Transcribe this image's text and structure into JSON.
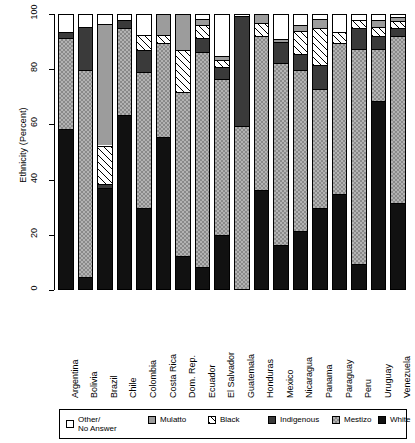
{
  "chart_data": {
    "type": "bar",
    "subtype": "stacked-bar-100",
    "title": "",
    "xlabel": "",
    "ylabel": "Ethnicity (Percent)",
    "ylim": [
      0,
      100
    ],
    "yticks": [
      0,
      20,
      40,
      60,
      80,
      100
    ],
    "grid": false,
    "legend_position": "bottom",
    "stack_order_bottom_to_top": [
      "White",
      "Indigenous",
      "Black",
      "Mulatto",
      "Mestizo",
      "Other/No Answer"
    ],
    "categories": [
      "Argentina",
      "Bolivia",
      "Brazil",
      "Chile",
      "Colombia",
      "Costa Rica",
      "Dom. Rep.",
      "Ecuador",
      "El Salvador",
      "Guatemala",
      "Honduras",
      "Mexico",
      "Nicaragua",
      "Panama",
      "Paraguay",
      "Peru",
      "Uruguay",
      "Venezuela"
    ],
    "series": [
      {
        "name": "White",
        "values": [
          58.0,
          4.5,
          36.5,
          63.0,
          29.5,
          55.0,
          12.0,
          8.0,
          19.5,
          0.0,
          36.0,
          16.0,
          21.0,
          29.5,
          34.5,
          9.0,
          68.0,
          31.0
        ]
      },
      {
        "name": "Indigenous",
        "values": [
          1.5,
          75.0,
          1.5,
          0.0,
          0.0,
          0.0,
          0.0,
          0.0,
          0.0,
          59.0,
          0.0,
          66.0,
          0.0,
          43.5,
          0.0,
          0.0,
          0.0,
          0.0
        ]
      },
      {
        "name": "Black",
        "values": [
          0.0,
          0.0,
          14.0,
          0.0,
          0.0,
          0.0,
          0.0,
          0.0,
          0.0,
          0.0,
          0.0,
          0.0,
          0.0,
          0.0,
          0.0,
          0.0,
          0.0,
          0.0
        ]
      },
      {
        "name": "Mulatto",
        "values": [
          0.0,
          0.0,
          44.0,
          0.0,
          0.0,
          0.0,
          0.0,
          0.0,
          0.0,
          0.0,
          0.0,
          0.0,
          0.0,
          0.0,
          0.0,
          0.0,
          0.0,
          0.0
        ]
      },
      {
        "name": "Mestizo",
        "values": [
          33.0,
          16.0,
          0.0,
          31.5,
          49.0,
          34.0,
          59.5,
          68.0,
          56.5,
          41.0,
          55.5,
          0.0,
          58.5,
          0.0,
          54.5,
          78.0,
          19.0,
          60.0
        ]
      },
      {
        "name": "Other/No Answer",
        "values": [
          7.5,
          4.5,
          4.0,
          5.5,
          21.5,
          11.0,
          28.5,
          24.0,
          24.0,
          0.0,
          8.5,
          18.0,
          20.5,
          27.0,
          11.0,
          13.0,
          13.0,
          9.0
        ]
      }
    ],
    "bars": [
      {
        "country": "Argentina",
        "segments": [
          {
            "label": "White",
            "from": 0,
            "to": 58.0
          },
          {
            "label": "Mestizo",
            "from": 58.0,
            "to": 91.0
          },
          {
            "label": "Indigenous",
            "from": 91.0,
            "to": 93.0
          },
          {
            "label": "Other/No Answer",
            "from": 93.0,
            "to": 100
          }
        ]
      },
      {
        "country": "Bolivia",
        "segments": [
          {
            "label": "White",
            "from": 0,
            "to": 4.5
          },
          {
            "label": "Mestizo",
            "from": 4.5,
            "to": 79.5
          },
          {
            "label": "Indigenous",
            "from": 79.5,
            "to": 95.0
          },
          {
            "label": "Other/No Answer",
            "from": 95.0,
            "to": 100
          }
        ]
      },
      {
        "country": "Brazil",
        "segments": [
          {
            "label": "White",
            "from": 0,
            "to": 36.5
          },
          {
            "label": "Indigenous",
            "from": 36.5,
            "to": 38.0
          },
          {
            "label": "Black",
            "from": 38.0,
            "to": 52.0
          },
          {
            "label": "Mulatto",
            "from": 52.0,
            "to": 96.0
          },
          {
            "label": "Other/No Answer",
            "from": 96.0,
            "to": 100
          }
        ]
      },
      {
        "country": "Chile",
        "segments": [
          {
            "label": "White",
            "from": 0,
            "to": 63.0
          },
          {
            "label": "Mestizo",
            "from": 63.0,
            "to": 94.5
          },
          {
            "label": "Indigenous",
            "from": 94.5,
            "to": 97.5
          },
          {
            "label": "Other/No Answer",
            "from": 97.5,
            "to": 100
          }
        ]
      },
      {
        "country": "Colombia",
        "segments": [
          {
            "label": "White",
            "from": 0,
            "to": 29.5
          },
          {
            "label": "Mestizo",
            "from": 29.5,
            "to": 78.5
          },
          {
            "label": "Indigenous",
            "from": 78.5,
            "to": 86.5
          },
          {
            "label": "Black",
            "from": 86.5,
            "to": 92.0
          },
          {
            "label": "Other/No Answer",
            "from": 92.0,
            "to": 100
          }
        ]
      },
      {
        "country": "Costa Rica",
        "segments": [
          {
            "label": "White",
            "from": 0,
            "to": 55.0
          },
          {
            "label": "Mestizo",
            "from": 55.0,
            "to": 89.0
          },
          {
            "label": "Black",
            "from": 89.0,
            "to": 92.0
          },
          {
            "label": "Mulatto",
            "from": 92.0,
            "to": 100
          }
        ]
      },
      {
        "country": "Dom. Rep.",
        "segments": [
          {
            "label": "White",
            "from": 0,
            "to": 12.0
          },
          {
            "label": "Mestizo",
            "from": 12.0,
            "to": 71.5
          },
          {
            "label": "Black",
            "from": 71.5,
            "to": 86.5
          },
          {
            "label": "Mulatto",
            "from": 86.5,
            "to": 100
          }
        ]
      },
      {
        "country": "Ecuador",
        "segments": [
          {
            "label": "White",
            "from": 0,
            "to": 8.0
          },
          {
            "label": "Mestizo",
            "from": 8.0,
            "to": 86.0
          },
          {
            "label": "Indigenous",
            "from": 86.0,
            "to": 91.0
          },
          {
            "label": "Black",
            "from": 91.0,
            "to": 95.5
          },
          {
            "label": "Mulatto",
            "from": 95.5,
            "to": 98.0
          },
          {
            "label": "Other/No Answer",
            "from": 98.0,
            "to": 100
          }
        ]
      },
      {
        "country": "El Salvador",
        "segments": [
          {
            "label": "White",
            "from": 0,
            "to": 19.5
          },
          {
            "label": "Mestizo",
            "from": 19.5,
            "to": 76.0
          },
          {
            "label": "Indigenous",
            "from": 76.0,
            "to": 80.5
          },
          {
            "label": "Black",
            "from": 80.5,
            "to": 83.0
          },
          {
            "label": "Mulatto",
            "from": 83.0,
            "to": 84.5
          },
          {
            "label": "Other/No Answer",
            "from": 84.5,
            "to": 100
          }
        ]
      },
      {
        "country": "Guatemala",
        "segments": [
          {
            "label": "Mestizo",
            "from": 0,
            "to": 59.0
          },
          {
            "label": "Indigenous",
            "from": 59.0,
            "to": 99.0
          },
          {
            "label": "Other/No Answer",
            "from": 99.0,
            "to": 100
          }
        ]
      },
      {
        "country": "Honduras",
        "segments": [
          {
            "label": "White",
            "from": 0,
            "to": 36.0
          },
          {
            "label": "Mestizo",
            "from": 36.0,
            "to": 91.5
          },
          {
            "label": "Black",
            "from": 91.5,
            "to": 96.5
          },
          {
            "label": "Mulatto",
            "from": 96.5,
            "to": 100
          }
        ]
      },
      {
        "country": "Mexico",
        "segments": [
          {
            "label": "White",
            "from": 0,
            "to": 16.0
          },
          {
            "label": "Mestizo",
            "from": 16.0,
            "to": 82.0
          },
          {
            "label": "Indigenous",
            "from": 82.0,
            "to": 89.5
          },
          {
            "label": "Mulatto",
            "from": 89.5,
            "to": 90.5
          },
          {
            "label": "Other/No Answer",
            "from": 90.5,
            "to": 100
          }
        ]
      },
      {
        "country": "Nicaragua",
        "segments": [
          {
            "label": "White",
            "from": 0,
            "to": 21.0
          },
          {
            "label": "Mestizo",
            "from": 21.0,
            "to": 79.5
          },
          {
            "label": "Indigenous",
            "from": 79.5,
            "to": 85.0
          },
          {
            "label": "Black",
            "from": 85.0,
            "to": 93.5
          },
          {
            "label": "Mulatto",
            "from": 93.5,
            "to": 95.5
          },
          {
            "label": "Other/No Answer",
            "from": 95.5,
            "to": 100
          }
        ]
      },
      {
        "country": "Panama",
        "segments": [
          {
            "label": "White",
            "from": 0,
            "to": 29.5
          },
          {
            "label": "Mestizo",
            "from": 29.5,
            "to": 72.5
          },
          {
            "label": "Indigenous",
            "from": 72.5,
            "to": 81.0
          },
          {
            "label": "Black",
            "from": 81.0,
            "to": 94.5
          },
          {
            "label": "Mulatto",
            "from": 94.5,
            "to": 98.0
          },
          {
            "label": "Other/No Answer",
            "from": 98.0,
            "to": 100
          }
        ]
      },
      {
        "country": "Paraguay",
        "segments": [
          {
            "label": "White",
            "from": 0,
            "to": 34.5
          },
          {
            "label": "Mestizo",
            "from": 34.5,
            "to": 89.0
          },
          {
            "label": "Black",
            "from": 89.0,
            "to": 93.0
          },
          {
            "label": "Other/No Answer",
            "from": 93.0,
            "to": 100
          }
        ]
      },
      {
        "country": "Peru",
        "segments": [
          {
            "label": "White",
            "from": 0,
            "to": 9.0
          },
          {
            "label": "Mestizo",
            "from": 9.0,
            "to": 87.0
          },
          {
            "label": "Indigenous",
            "from": 87.0,
            "to": 94.5
          },
          {
            "label": "Black",
            "from": 94.5,
            "to": 97.5
          },
          {
            "label": "Other/No Answer",
            "from": 97.5,
            "to": 100
          }
        ]
      },
      {
        "country": "Uruguay",
        "segments": [
          {
            "label": "White",
            "from": 0,
            "to": 68.0
          },
          {
            "label": "Mestizo",
            "from": 68.0,
            "to": 87.0
          },
          {
            "label": "Indigenous",
            "from": 87.0,
            "to": 91.5
          },
          {
            "label": "Black",
            "from": 91.5,
            "to": 95.0
          },
          {
            "label": "Mulatto",
            "from": 95.0,
            "to": 97.5
          },
          {
            "label": "Other/No Answer",
            "from": 97.5,
            "to": 100
          }
        ]
      },
      {
        "country": "Venezuela",
        "segments": [
          {
            "label": "White",
            "from": 0,
            "to": 31.0
          },
          {
            "label": "Mestizo",
            "from": 31.0,
            "to": 91.5
          },
          {
            "label": "Indigenous",
            "from": 91.5,
            "to": 94.5
          },
          {
            "label": "Black",
            "from": 94.5,
            "to": 97.0
          },
          {
            "label": "Mulatto",
            "from": 97.0,
            "to": 98.5
          },
          {
            "label": "Other/No Answer",
            "from": 98.5,
            "to": 100
          }
        ]
      }
    ],
    "legend": [
      {
        "label_line1": "Other/",
        "label_line2": "No Answer",
        "key": "Other/No Answer",
        "swatch": "f-other"
      },
      {
        "label_line1": "Mulatto",
        "label_line2": "",
        "key": "Mulatto",
        "swatch": "f-mulatto"
      },
      {
        "label_line1": "Black",
        "label_line2": "",
        "key": "Black",
        "swatch": "f-black"
      },
      {
        "label_line1": "Indigenous",
        "label_line2": "",
        "key": "Indigenous",
        "swatch": "f-indigenous"
      },
      {
        "label_line1": "Mestizo",
        "label_line2": "",
        "key": "Mestizo",
        "swatch": "f-mestizo"
      },
      {
        "label_line1": "White",
        "label_line2": "",
        "key": "White",
        "swatch": "f-white"
      }
    ],
    "colors": {
      "White": "#111111",
      "Indigenous": "#3a3a3a",
      "Black": "#ffffff",
      "Mulatto": "#9c9c9c",
      "Mestizo": "#b3b3b3",
      "Other/No Answer": "#ffffff",
      "axis": "#000000",
      "background": "#ffffff"
    }
  }
}
